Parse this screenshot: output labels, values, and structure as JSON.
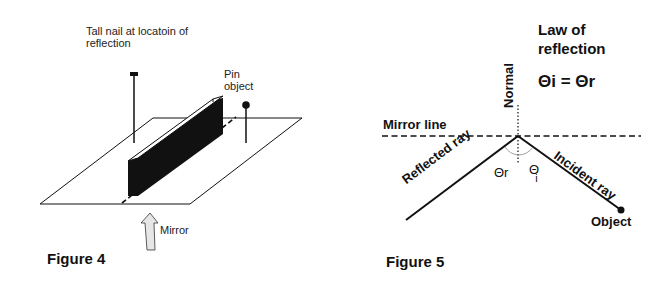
{
  "figure4": {
    "caption": "Figure 4",
    "labels": {
      "nail_line1": "Tall nail at locatoin of",
      "nail_line2": "reflection",
      "pin_line1": "Pin",
      "pin_line2": "object",
      "mirror": "Mirror"
    }
  },
  "figure5": {
    "caption": "Figure 5",
    "title_line1": "Law of",
    "title_line2": "reflection",
    "equation": "Θi = Θr",
    "labels": {
      "normal": "Normal",
      "mirror_line": "Mirror line",
      "reflected_ray": "Reflected ray",
      "incident_ray": "Incident ray",
      "theta_r": "Θr",
      "theta_i_symbol": "Θ",
      "theta_i_sub": "i",
      "object": "Object"
    }
  }
}
